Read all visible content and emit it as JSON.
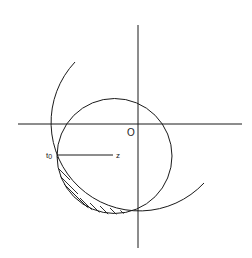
{
  "diagram": {
    "labels": {
      "origin": "O",
      "point": "t",
      "point_subscript": "0",
      "direction": "z"
    },
    "colors": {
      "stroke": "#1a1a1a",
      "background": "#ffffff"
    }
  }
}
